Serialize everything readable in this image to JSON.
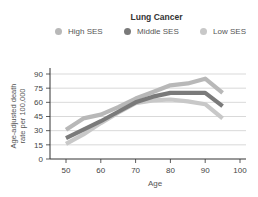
{
  "chart_data": {
    "type": "line",
    "title": "Lung Cancer",
    "xlabel": "Age",
    "ylabel": "Age-adjusted death rate per 100,000",
    "ylabel_lines": [
      "Age-adjusted death",
      "rate per 100,000"
    ],
    "x": [
      50,
      55,
      60,
      65,
      70,
      75,
      80,
      85,
      90,
      95
    ],
    "xticks": [
      50,
      60,
      70,
      80,
      90,
      100
    ],
    "yticks": [
      0,
      15,
      30,
      45,
      60,
      75,
      90
    ],
    "xlim": [
      50,
      100
    ],
    "ylim": [
      0,
      95
    ],
    "grid": "horizontal",
    "legend_position": "top",
    "series": [
      {
        "name": "High SES",
        "color": "#b8b8b8",
        "values": [
          31,
          43,
          47,
          55,
          64,
          71,
          78,
          80,
          85,
          70
        ]
      },
      {
        "name": "Middle SES",
        "color": "#7a7a7a",
        "values": [
          22,
          31,
          40,
          50,
          60,
          66,
          70,
          70,
          70,
          56
        ]
      },
      {
        "name": "Low SES",
        "color": "#c8c8c8",
        "values": [
          16,
          26,
          38,
          49,
          59,
          62,
          63,
          61,
          58,
          43
        ]
      }
    ]
  },
  "legend": [
    {
      "label": "High SES",
      "color": "#b8b8b8"
    },
    {
      "label": "Middle SES",
      "color": "#7a7a7a"
    },
    {
      "label": "Low SES",
      "color": "#c8c8c8"
    }
  ]
}
